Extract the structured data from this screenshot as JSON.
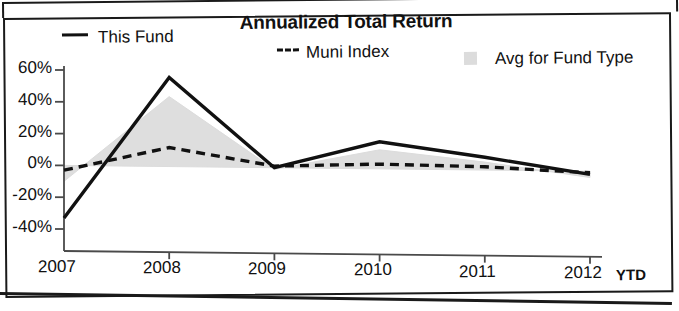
{
  "chart_data": {
    "type": "area",
    "title": "Annualized Total Return",
    "xlabel": "",
    "ylabel": "",
    "x": [
      "2007",
      "2008",
      "2009",
      "2010",
      "2011",
      "2012"
    ],
    "categories": [
      "2007",
      "2008",
      "2009",
      "2010",
      "2011",
      "2012"
    ],
    "x_axis_note": "YTD",
    "ylim": [
      -40,
      60
    ],
    "ytick_labels": [
      "60%",
      "40%",
      "20%",
      "0%",
      "-20%",
      "-40%"
    ],
    "ytick_values": [
      60,
      40,
      20,
      0,
      -20,
      -40
    ],
    "grid": false,
    "legend_position": "top",
    "series": [
      {
        "name": "This Fund",
        "style": "solid-line",
        "color": "#111111",
        "values": [
          -33,
          56,
          0,
          17,
          8,
          -2
        ]
      },
      {
        "name": "Muni Index",
        "style": "dashed-line",
        "color": "#111111",
        "values": [
          -3,
          12,
          1,
          3,
          2,
          -1
        ]
      },
      {
        "name": "Avg for Fund Type",
        "style": "filled-area",
        "color": "#dcdcdc",
        "values": [
          -10,
          44,
          -1,
          12,
          5,
          -4
        ]
      }
    ]
  },
  "chart": {
    "title": "Annualized Total Return",
    "ytd_suffix": "YTD",
    "legend": [
      {
        "marker": "solid-line-swatch",
        "label": "This Fund"
      },
      {
        "marker": "dashed-line-swatch",
        "label": "Muni Index"
      },
      {
        "marker": "gray-area-swatch",
        "label": "Avg for Fund Type"
      }
    ],
    "y_axis": {
      "ticks": [
        "60%",
        "40%",
        "20%",
        "0%",
        "-20%",
        "-40%"
      ]
    },
    "x_axis": {
      "ticks": [
        "2007",
        "2008",
        "2009",
        "2010",
        "2011",
        "2012"
      ]
    }
  }
}
